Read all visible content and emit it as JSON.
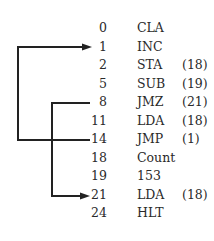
{
  "diagram": {
    "rows": [
      {
        "address": "0",
        "mnemonic": "CLA",
        "operand": ""
      },
      {
        "address": "1",
        "mnemonic": "INC",
        "operand": ""
      },
      {
        "address": "2",
        "mnemonic": "STA",
        "operand": "(18)"
      },
      {
        "address": "5",
        "mnemonic": "SUB",
        "operand": "(19)"
      },
      {
        "address": "8",
        "mnemonic": "JMZ",
        "operand": "(21)"
      },
      {
        "address": "11",
        "mnemonic": "LDA",
        "operand": "(18)"
      },
      {
        "address": "14",
        "mnemonic": "JMP",
        "operand": "(1)"
      },
      {
        "address": "18",
        "mnemonic": "Count",
        "operand": ""
      },
      {
        "address": "19",
        "mnemonic": "153",
        "operand": ""
      },
      {
        "address": "21",
        "mnemonic": "LDA",
        "operand": "(18)"
      },
      {
        "address": "24",
        "mnemonic": "HLT",
        "operand": ""
      }
    ],
    "arrows": [
      {
        "from": "14",
        "to": "1",
        "label": "jump-back"
      },
      {
        "from": "8",
        "to": "21",
        "label": "jump-if-zero"
      }
    ],
    "line_color": "#222222"
  }
}
